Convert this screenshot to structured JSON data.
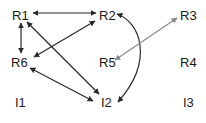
{
  "diagram": {
    "type": "directed-graph",
    "colors": {
      "dark_edge": "#2a2a2a",
      "light_edge": "#8a8a8a",
      "label": "#1a1a1a",
      "background": "#ffffff"
    },
    "nodes": [
      {
        "id": "R1",
        "label": "R1",
        "x": 12,
        "y": 20
      },
      {
        "id": "R2",
        "label": "R2",
        "x": 99,
        "y": 20
      },
      {
        "id": "R3",
        "label": "R3",
        "x": 180,
        "y": 20
      },
      {
        "id": "R6",
        "label": "R6",
        "x": 11,
        "y": 67
      },
      {
        "id": "R5",
        "label": "R5",
        "x": 99,
        "y": 67
      },
      {
        "id": "R4",
        "label": "R4",
        "x": 180,
        "y": 67
      },
      {
        "id": "I1",
        "label": "I1",
        "x": 15,
        "y": 107
      },
      {
        "id": "I2",
        "label": "I2",
        "x": 101,
        "y": 107
      },
      {
        "id": "I3",
        "label": "I3",
        "x": 183,
        "y": 107
      }
    ],
    "edges": [
      {
        "from": "R1",
        "to": "R2",
        "direction": "both",
        "style": "dark"
      },
      {
        "from": "R1",
        "to": "R6",
        "direction": "both",
        "style": "dark"
      },
      {
        "from": "R6",
        "to": "R2",
        "direction": "both",
        "style": "dark"
      },
      {
        "from": "R1",
        "to": "I2",
        "direction": "both",
        "style": "dark"
      },
      {
        "from": "R6",
        "to": "I2",
        "direction": "both",
        "style": "dark"
      },
      {
        "from": "R2",
        "to": "I2",
        "direction": "both",
        "style": "dark",
        "shape": "curved"
      },
      {
        "from": "R3",
        "to": "R5",
        "direction": "both",
        "style": "light"
      }
    ]
  }
}
